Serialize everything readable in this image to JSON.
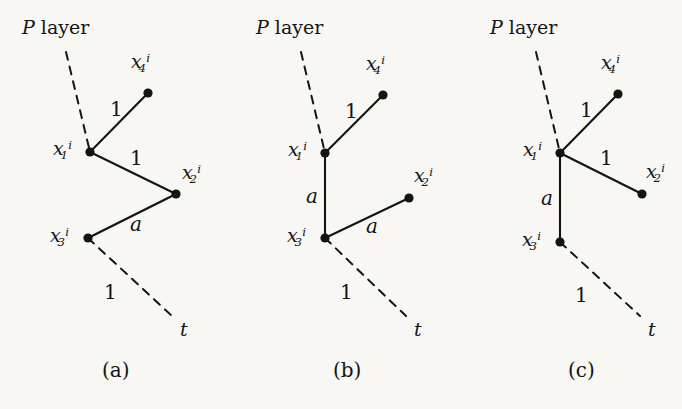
{
  "figure": {
    "background_color": "#f8f7f4",
    "ink_color": "#141414",
    "width": 682,
    "height": 409
  },
  "panels": [
    {
      "id": "a",
      "caption": "(a)",
      "caption_pos": {
        "x": 102,
        "y": 358
      },
      "layer_label": {
        "p": "P",
        "rest": " layer",
        "x": 22,
        "y": 16
      },
      "sink_label": {
        "text": "t",
        "x": 180,
        "y": 318
      },
      "nodes": [
        {
          "name": "x1",
          "base": "x",
          "sub": "1",
          "sup": "i",
          "cx": 90,
          "cy": 152,
          "label_x": 53,
          "label_y": 139
        },
        {
          "name": "x2",
          "base": "x",
          "sub": "2",
          "sup": "i",
          "cx": 176,
          "cy": 194,
          "label_x": 182,
          "label_y": 163
        },
        {
          "name": "x3",
          "base": "x",
          "sub": "3",
          "sup": "i",
          "cx": 88,
          "cy": 238,
          "label_x": 50,
          "label_y": 226
        },
        {
          "name": "x4",
          "base": "x",
          "sub": "4",
          "sup": "i",
          "cx": 148,
          "cy": 93,
          "label_x": 131,
          "label_y": 52
        }
      ],
      "solid_edges": [
        {
          "from": "x1",
          "to": "x4",
          "x1": 90,
          "y1": 152,
          "x2": 148,
          "y2": 93,
          "label": "1",
          "numeric": true,
          "label_x": 110,
          "label_y": 99
        },
        {
          "from": "x1",
          "to": "x2",
          "x1": 90,
          "y1": 152,
          "x2": 176,
          "y2": 194,
          "label": "1",
          "numeric": true,
          "label_x": 130,
          "label_y": 148
        },
        {
          "from": "x3",
          "to": "x2",
          "x1": 88,
          "y1": 238,
          "x2": 176,
          "y2": 194,
          "label": "a",
          "numeric": false,
          "label_x": 130,
          "label_y": 214
        }
      ],
      "dashed_edges": [
        {
          "name": "p-layer-edge",
          "x1": 66,
          "y1": 52,
          "x2": 90,
          "y2": 152,
          "label": null
        },
        {
          "name": "sink-edge",
          "x1": 88,
          "y1": 238,
          "x2": 172,
          "y2": 316,
          "label": "1",
          "numeric": true,
          "label_x": 104,
          "label_y": 282
        }
      ]
    },
    {
      "id": "b",
      "caption": "(b)",
      "caption_pos": {
        "x": 333,
        "y": 358
      },
      "layer_label": {
        "p": "P",
        "rest": " layer",
        "x": 256,
        "y": 16
      },
      "sink_label": {
        "text": "t",
        "x": 414,
        "y": 318
      },
      "nodes": [
        {
          "name": "x1",
          "base": "x",
          "sub": "1",
          "sup": "i",
          "cx": 325,
          "cy": 153,
          "label_x": 288,
          "label_y": 140
        },
        {
          "name": "x2",
          "base": "x",
          "sub": "2",
          "sup": "i",
          "cx": 409,
          "cy": 198,
          "label_x": 414,
          "label_y": 166
        },
        {
          "name": "x3",
          "base": "x",
          "sub": "3",
          "sup": "i",
          "cx": 325,
          "cy": 238,
          "label_x": 287,
          "label_y": 226
        },
        {
          "name": "x4",
          "base": "x",
          "sub": "4",
          "sup": "i",
          "cx": 383,
          "cy": 95,
          "label_x": 366,
          "label_y": 54
        }
      ],
      "solid_edges": [
        {
          "from": "x1",
          "to": "x4",
          "x1": 325,
          "y1": 153,
          "x2": 383,
          "y2": 95,
          "label": "1",
          "numeric": true,
          "label_x": 345,
          "label_y": 101
        },
        {
          "from": "x1",
          "to": "x3",
          "x1": 325,
          "y1": 153,
          "x2": 325,
          "y2": 238,
          "label": "a",
          "numeric": false,
          "label_x": 306,
          "label_y": 186
        },
        {
          "from": "x3",
          "to": "x2",
          "x1": 325,
          "y1": 238,
          "x2": 409,
          "y2": 198,
          "label": "a",
          "numeric": false,
          "label_x": 366,
          "label_y": 216
        }
      ],
      "dashed_edges": [
        {
          "name": "p-layer-edge",
          "x1": 301,
          "y1": 52,
          "x2": 325,
          "y2": 153,
          "label": null
        },
        {
          "name": "sink-edge",
          "x1": 325,
          "y1": 238,
          "x2": 406,
          "y2": 316,
          "label": "1",
          "numeric": true,
          "label_x": 340,
          "label_y": 282
        }
      ]
    },
    {
      "id": "c",
      "caption": "(c)",
      "caption_pos": {
        "x": 568,
        "y": 358
      },
      "layer_label": {
        "p": "P",
        "rest": " layer",
        "x": 490,
        "y": 16
      },
      "sink_label": {
        "text": "t",
        "x": 648,
        "y": 318
      },
      "nodes": [
        {
          "name": "x1",
          "base": "x",
          "sub": "1",
          "sup": "i",
          "cx": 560,
          "cy": 153,
          "label_x": 523,
          "label_y": 140
        },
        {
          "name": "x2",
          "base": "x",
          "sub": "2",
          "sup": "i",
          "cx": 642,
          "cy": 194,
          "label_x": 646,
          "label_y": 162
        },
        {
          "name": "x3",
          "base": "x",
          "sub": "3",
          "sup": "i",
          "cx": 560,
          "cy": 242,
          "label_x": 522,
          "label_y": 230
        },
        {
          "name": "x4",
          "base": "x",
          "sub": "4",
          "sup": "i",
          "cx": 618,
          "cy": 94,
          "label_x": 601,
          "label_y": 53
        }
      ],
      "solid_edges": [
        {
          "from": "x1",
          "to": "x4",
          "x1": 560,
          "y1": 153,
          "x2": 618,
          "y2": 94,
          "label": "1",
          "numeric": true,
          "label_x": 580,
          "label_y": 100
        },
        {
          "from": "x1",
          "to": "x2",
          "x1": 560,
          "y1": 153,
          "x2": 642,
          "y2": 194,
          "label": "1",
          "numeric": true,
          "label_x": 600,
          "label_y": 148
        },
        {
          "from": "x1",
          "to": "x3",
          "x1": 560,
          "y1": 153,
          "x2": 560,
          "y2": 242,
          "label": "a",
          "numeric": false,
          "label_x": 541,
          "label_y": 188
        }
      ],
      "dashed_edges": [
        {
          "name": "p-layer-edge",
          "x1": 536,
          "y1": 52,
          "x2": 560,
          "y2": 153,
          "label": null
        },
        {
          "name": "sink-edge",
          "x1": 560,
          "y1": 242,
          "x2": 640,
          "y2": 316,
          "label": "1",
          "numeric": true,
          "label_x": 575,
          "label_y": 285
        }
      ]
    }
  ]
}
